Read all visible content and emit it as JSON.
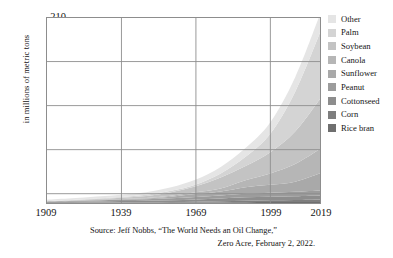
{
  "chart_data": {
    "type": "area",
    "stacked": true,
    "title": "",
    "subtitle": "",
    "xlabel": "",
    "ylabel": "in millions of metric tons",
    "xlim": [
      1909,
      2019
    ],
    "ylim": [
      0,
      210
    ],
    "grid": true,
    "legend_position": "right",
    "x_ticks": [
      "1909",
      "1939",
      "1969",
      "1999",
      "2019"
    ],
    "x_tick_values": [
      1909,
      1939,
      1969,
      1999,
      2019
    ],
    "y_ticks": [
      "10",
      "60",
      "110",
      "160",
      "210"
    ],
    "y_tick_values": [
      10,
      60,
      110,
      160,
      210
    ],
    "x": [
      1909,
      1919,
      1929,
      1939,
      1949,
      1959,
      1969,
      1979,
      1989,
      1999,
      2009,
      2019
    ],
    "series": [
      {
        "name": "Rice bran",
        "color": "#6f6f6f",
        "values": [
          0.1,
          0.15,
          0.2,
          0.25,
          0.3,
          0.4,
          0.5,
          0.7,
          0.9,
          1.0,
          1.1,
          1.2
        ]
      },
      {
        "name": "Corn",
        "color": "#7e7e7e",
        "values": [
          0.1,
          0.2,
          0.3,
          0.4,
          0.5,
          0.7,
          1.0,
          1.3,
          1.7,
          2.0,
          2.3,
          2.8
        ]
      },
      {
        "name": "Cottonseed",
        "color": "#8d8d8d",
        "values": [
          0.8,
          1.0,
          1.3,
          1.5,
          1.7,
          2.1,
          2.6,
          3.1,
          3.8,
          4.0,
          4.3,
          4.6
        ]
      },
      {
        "name": "Peanut",
        "color": "#9c9c9c",
        "values": [
          0.5,
          0.8,
          1.1,
          1.4,
          1.7,
          2.2,
          2.8,
          3.3,
          4.0,
          4.6,
          5.0,
          5.6
        ]
      },
      {
        "name": "Sunflower",
        "color": "#a9a9a9",
        "values": [
          0.2,
          0.3,
          0.5,
          0.7,
          1.0,
          1.8,
          3.2,
          4.6,
          7.5,
          9.0,
          11.5,
          19.5
        ]
      },
      {
        "name": "Canola",
        "color": "#b6b6b6",
        "values": [
          0.1,
          0.2,
          0.3,
          0.4,
          0.6,
          1.1,
          2.0,
          3.5,
          8.0,
          13.0,
          20.0,
          27.5
        ]
      },
      {
        "name": "Soybean",
        "color": "#c3c3c3",
        "values": [
          0.2,
          0.4,
          0.8,
          1.2,
          2.2,
          4.0,
          7.0,
          12.5,
          16.0,
          24.0,
          37.0,
          57.0
        ]
      },
      {
        "name": "Palm",
        "color": "#d4d4d4",
        "values": [
          0.2,
          0.4,
          0.7,
          1.0,
          1.3,
          1.5,
          2.0,
          4.5,
          10.5,
          21.0,
          45.0,
          75.0
        ]
      },
      {
        "name": "Other",
        "color": "#e5e5e5",
        "values": [
          1.5,
          1.8,
          2.2,
          2.6,
          3.0,
          4.0,
          5.5,
          7.5,
          10.0,
          13.0,
          16.5,
          21.0
        ]
      }
    ],
    "totals": [
      3.7,
      5.25,
      7.4,
      9.45,
      12.3,
      17.8,
      26.6,
      41.0,
      62.4,
      91.6,
      142.7,
      214.2
    ],
    "caption_line_1": "Source: Jeff Nobbs, “The World Needs an Oil Change,”",
    "caption_line_2": "Zero Acre, February 2, 2022."
  },
  "axes": {
    "y_title": "in millions of metric tons"
  },
  "legend": {
    "items": [
      {
        "label": "Other",
        "color": "#e5e5e5"
      },
      {
        "label": "Palm",
        "color": "#d4d4d4"
      },
      {
        "label": "Soybean",
        "color": "#c3c3c3"
      },
      {
        "label": "Canola",
        "color": "#b6b6b6"
      },
      {
        "label": "Sunflower",
        "color": "#a9a9a9"
      },
      {
        "label": "Peanut",
        "color": "#9c9c9c"
      },
      {
        "label": "Cottonseed",
        "color": "#8d8d8d"
      },
      {
        "label": "Corn",
        "color": "#7e7e7e"
      },
      {
        "label": "Rice bran",
        "color": "#6f6f6f"
      }
    ]
  },
  "caption": {
    "line1": "Source: Jeff Nobbs, “The World Needs an Oil Change,”",
    "line2": "Zero Acre, February 2, 2022."
  },
  "colors": {
    "frame": "#8d8d8d",
    "grid": "#8d8d8d",
    "text": "#141414",
    "background": "#ffffff"
  }
}
